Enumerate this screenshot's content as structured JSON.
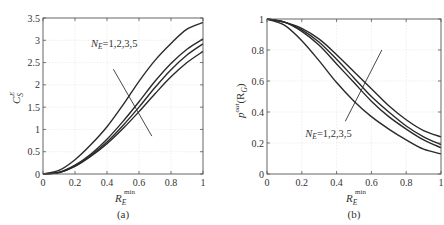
{
  "chart_data": [
    {
      "id": "a",
      "type": "line",
      "title": "",
      "caption": "(a)",
      "xlabel": "R_E^min",
      "xlabel_main": "R",
      "xlabel_sub": "E",
      "xlabel_sup": "min",
      "ylabel": "C_S^E",
      "ylabel_main": "C",
      "ylabel_sub": "S",
      "ylabel_sup": "E",
      "xlim": [
        0,
        1
      ],
      "ylim": [
        0,
        3.5
      ],
      "xticks": [
        0,
        0.2,
        0.4,
        0.6,
        0.8,
        1
      ],
      "xtick_labels": [
        "0",
        "0.2",
        "0.4",
        "0.6",
        "0.8",
        "1"
      ],
      "yticks": [
        0,
        0.5,
        1,
        1.5,
        2,
        2.5,
        3,
        3.5
      ],
      "ytick_labels": [
        "0",
        "0.5",
        "1",
        "1.5",
        "2",
        "2.5",
        "3",
        "3.5"
      ],
      "grid": true,
      "annotation": "N_E=1,2,3,5",
      "annotation_main": "N",
      "annotation_sub": "E",
      "annotation_rest": "=1,2,3,5",
      "annotation_pos": [
        0.3,
        2.85
      ],
      "arrow": [
        [
          0.44,
          2.35
        ],
        [
          0.68,
          0.85
        ]
      ],
      "x": [
        0,
        0.1,
        0.2,
        0.3,
        0.4,
        0.5,
        0.6,
        0.7,
        0.8,
        0.9,
        1.0
      ],
      "series": [
        {
          "name": "N_E=1",
          "values": [
            0,
            0.08,
            0.32,
            0.66,
            1.06,
            1.55,
            2.08,
            2.55,
            2.93,
            3.25,
            3.4
          ]
        },
        {
          "name": "N_E=2",
          "values": [
            0,
            0.04,
            0.2,
            0.45,
            0.78,
            1.18,
            1.62,
            2.08,
            2.48,
            2.8,
            3.03
          ]
        },
        {
          "name": "N_E=3",
          "values": [
            0,
            0.03,
            0.18,
            0.42,
            0.72,
            1.09,
            1.5,
            1.94,
            2.34,
            2.67,
            2.92
          ]
        },
        {
          "name": "N_E=5",
          "values": [
            0,
            0.03,
            0.17,
            0.4,
            0.68,
            1.02,
            1.4,
            1.8,
            2.18,
            2.5,
            2.75
          ]
        }
      ]
    },
    {
      "id": "b",
      "type": "line",
      "title": "",
      "caption": "(b)",
      "xlabel": "R_E^min",
      "xlabel_main": "R",
      "xlabel_sub": "E",
      "xlabel_sup": "min",
      "ylabel": "p^out(R_G)",
      "ylabel_main": "p",
      "ylabel_sup": "out",
      "ylabel_rest": "(R",
      "ylabel_sub": "G",
      "ylabel_end": ")",
      "xlim": [
        0,
        1
      ],
      "ylim": [
        0,
        1
      ],
      "xticks": [
        0,
        0.2,
        0.4,
        0.6,
        0.8,
        1
      ],
      "xtick_labels": [
        "0",
        "0.2",
        "0.4",
        "0.6",
        "0.8",
        "1"
      ],
      "yticks": [
        0,
        0.2,
        0.4,
        0.6,
        0.8,
        1
      ],
      "ytick_labels": [
        "0",
        "0.2",
        "0.4",
        "0.6",
        "0.8",
        "1"
      ],
      "grid": true,
      "annotation": "N_E=1,2,3,5",
      "annotation_main": "N",
      "annotation_sub": "E",
      "annotation_rest": "=1,2,3,5",
      "annotation_pos": [
        0.22,
        0.24
      ],
      "arrow": [
        [
          0.45,
          0.34
        ],
        [
          0.66,
          0.8
        ]
      ],
      "x": [
        0,
        0.1,
        0.2,
        0.3,
        0.4,
        0.5,
        0.6,
        0.7,
        0.8,
        0.9,
        1.0
      ],
      "series": [
        {
          "name": "N_E=1",
          "values": [
            1,
            0.96,
            0.86,
            0.73,
            0.59,
            0.47,
            0.37,
            0.29,
            0.22,
            0.16,
            0.13
          ]
        },
        {
          "name": "N_E=2",
          "values": [
            1,
            0.98,
            0.92,
            0.83,
            0.71,
            0.59,
            0.47,
            0.37,
            0.29,
            0.22,
            0.17
          ]
        },
        {
          "name": "N_E=3",
          "values": [
            1,
            0.98,
            0.93,
            0.85,
            0.74,
            0.62,
            0.5,
            0.4,
            0.31,
            0.24,
            0.19
          ]
        },
        {
          "name": "N_E=5",
          "values": [
            1,
            0.98,
            0.94,
            0.87,
            0.77,
            0.66,
            0.55,
            0.44,
            0.35,
            0.28,
            0.24
          ]
        }
      ]
    }
  ]
}
